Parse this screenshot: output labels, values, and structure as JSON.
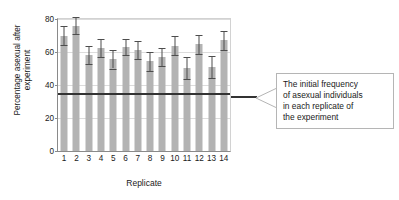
{
  "chart_data": {
    "type": "bar",
    "title": "",
    "xlabel": "Replicate",
    "ylabel": "Percentage asexual after\nexperiment",
    "categories": [
      "1",
      "2",
      "3",
      "4",
      "5",
      "6",
      "7",
      "8",
      "9",
      "10",
      "11",
      "12",
      "13",
      "14"
    ],
    "values": [
      70,
      76,
      58,
      62.5,
      55.5,
      63,
      61,
      54.5,
      57,
      63.5,
      50.5,
      65,
      51,
      67
    ],
    "errors_upper": [
      75.5,
      81.5,
      63.5,
      68,
      61.5,
      68,
      66.5,
      60,
      62.5,
      69.5,
      57,
      70.5,
      57.5,
      72.5
    ],
    "errors_lower": [
      64,
      71,
      52.5,
      57,
      50,
      58,
      55.5,
      48.5,
      51.5,
      58,
      43.5,
      59,
      44.5,
      61
    ],
    "ylim": [
      0,
      80
    ],
    "yticks": [
      0,
      20,
      40,
      60,
      80
    ],
    "ytick_labels": [
      "0",
      "20",
      "40",
      "60",
      "80"
    ],
    "grid": true,
    "legend": "none",
    "reference_line": {
      "value": 35,
      "label": "The initial frequency of asexual individuals in each replicate of the experiment"
    },
    "bar_color": "#b3b3b3",
    "error_color": "#4d4d4d",
    "reference_line_color": "#333333",
    "grid_color": "#dcdcdc",
    "axis_color": "#8a8a8a"
  },
  "annotation": {
    "line1": "The initial frequency",
    "line2": "of asexual individuals",
    "line3": "in each replicate of",
    "line4": "the experiment"
  }
}
